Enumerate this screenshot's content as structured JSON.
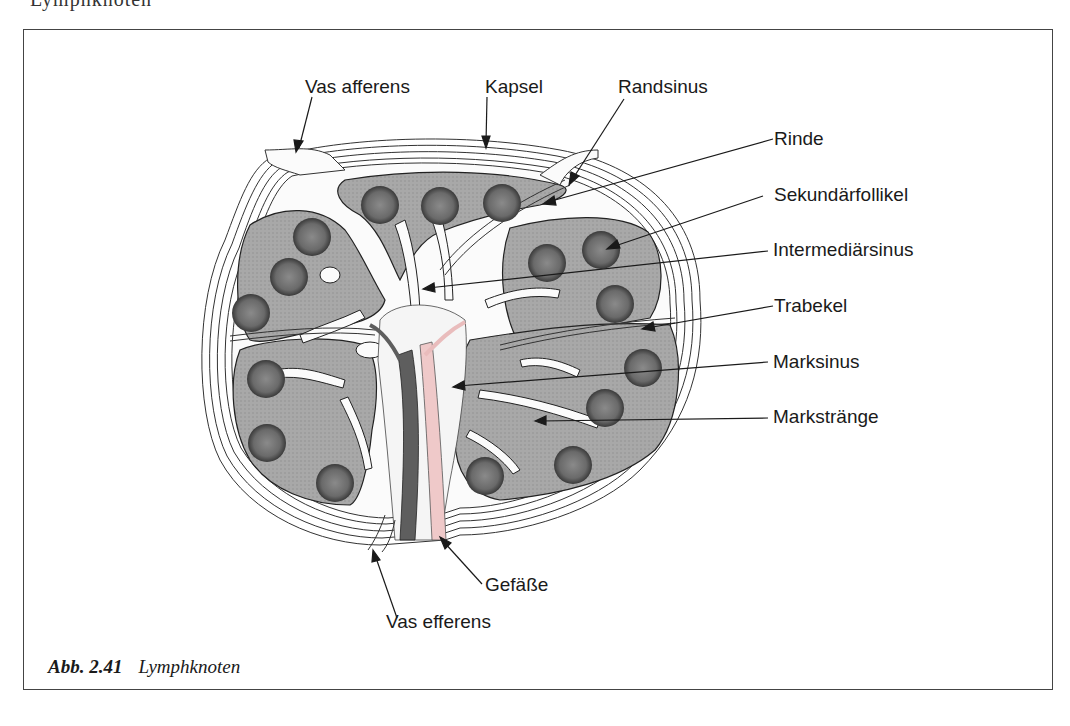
{
  "figure": {
    "top_cut_text": "Lymphknoten",
    "caption_number": "Abb. 2.41",
    "caption_title": "Lymphknoten"
  },
  "labels": {
    "vas_afferens": "Vas afferens",
    "kapsel": "Kapsel",
    "randsinus": "Randsinus",
    "rinde": "Rinde",
    "sekundaerfollikel": "Sekundärfollikel",
    "intermediaersinus": "Intermediärsinus",
    "trabekel": "Trabekel",
    "marksinus": "Marksinus",
    "markstraenge": "Markstränge",
    "gefaesse": "Gefäße",
    "vas_efferens": "Vas efferens"
  },
  "colors": {
    "tissue_gray": "#a9a9a9",
    "follicle_dark": "#4a4a4a",
    "vessel_pink": "#efc9c9",
    "vessel_dark": "#5e5e5e",
    "line": "#1a1a1a"
  }
}
